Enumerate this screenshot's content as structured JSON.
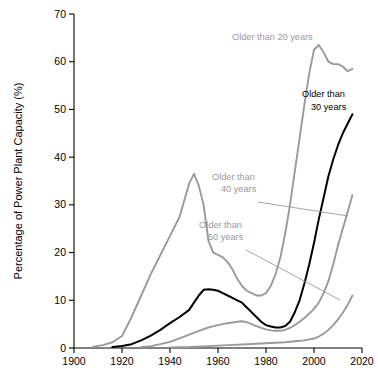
{
  "chart_data": {
    "type": "line",
    "title": "",
    "xlabel": "",
    "ylabel": "Percentage of Power Plant Capacity (%)",
    "xlim": [
      1900,
      2020
    ],
    "ylim": [
      0,
      70
    ],
    "xticks": [
      "1900",
      "1920",
      "1940",
      "1960",
      "1980",
      "2000",
      "2020"
    ],
    "yticks": [
      "0",
      "10",
      "20",
      "30",
      "40",
      "50",
      "60",
      "70"
    ],
    "grid": false,
    "legend_position": "inline-annotations",
    "colors": {
      "gray": "#9a9a9a",
      "black": "#000000",
      "axis": "#000000"
    },
    "annotations": [
      {
        "name": "older-than-20",
        "text_line1": "Older than 20 years",
        "text_line2": "",
        "color": "#9a9a9a"
      },
      {
        "name": "older-than-30",
        "text_line1": "Older than",
        "text_line2": "30 years",
        "color": "#000000"
      },
      {
        "name": "older-than-40",
        "text_line1": "Older than",
        "text_line2": "40 years",
        "color": "#9a9a9a"
      },
      {
        "name": "older-than-50",
        "text_line1": "Older than",
        "text_line2": "50 years",
        "color": "#9a9a9a"
      }
    ],
    "series": [
      {
        "name": "Older than 20 years",
        "color": "#9a9a9a",
        "x": [
          1908,
          1912,
          1916,
          1920,
          1924,
          1928,
          1932,
          1936,
          1940,
          1944,
          1946,
          1948,
          1950,
          1952,
          1954,
          1956,
          1958,
          1960,
          1962,
          1964,
          1966,
          1968,
          1970,
          1972,
          1974,
          1976,
          1978,
          1980,
          1982,
          1984,
          1986,
          1988,
          1990,
          1992,
          1994,
          1996,
          1998,
          2000,
          2002,
          2004,
          2006,
          2008,
          2010,
          2012,
          2014,
          2016
        ],
        "y": [
          0.3,
          0.6,
          1.2,
          2.5,
          6.5,
          11.0,
          15.5,
          19.5,
          23.5,
          27.5,
          31.0,
          34.5,
          36.5,
          34.0,
          30.0,
          22.5,
          20.0,
          19.5,
          19.0,
          18.0,
          16.5,
          14.5,
          13.0,
          12.0,
          11.5,
          11.0,
          11.0,
          11.5,
          13.0,
          15.5,
          19.0,
          24.0,
          30.0,
          37.0,
          44.0,
          51.0,
          57.5,
          62.5,
          63.5,
          62.0,
          60.0,
          59.5,
          59.5,
          59.0,
          58.0,
          58.5
        ]
      },
      {
        "name": "Older than 30 years",
        "color": "#000000",
        "x": [
          1916,
          1920,
          1924,
          1928,
          1932,
          1936,
          1940,
          1944,
          1948,
          1950,
          1952,
          1954,
          1956,
          1958,
          1960,
          1962,
          1964,
          1966,
          1968,
          1970,
          1972,
          1974,
          1976,
          1978,
          1980,
          1982,
          1984,
          1986,
          1988,
          1990,
          1992,
          1994,
          1996,
          1998,
          2000,
          2002,
          2004,
          2006,
          2008,
          2010,
          2012,
          2014,
          2016
        ],
        "y": [
          0.2,
          0.4,
          0.8,
          1.6,
          2.6,
          3.8,
          5.2,
          6.5,
          8.0,
          9.5,
          11.0,
          12.2,
          12.3,
          12.2,
          12.0,
          11.5,
          11.0,
          10.5,
          10.0,
          9.5,
          8.5,
          7.5,
          6.5,
          5.5,
          4.8,
          4.5,
          4.3,
          4.3,
          4.6,
          5.5,
          7.5,
          10.0,
          13.5,
          17.5,
          22.0,
          27.0,
          31.5,
          36.0,
          39.5,
          42.5,
          45.0,
          47.0,
          49.0
        ]
      },
      {
        "name": "Older than 40 years",
        "color": "#9a9a9a",
        "x": [
          1928,
          1932,
          1936,
          1940,
          1944,
          1948,
          1952,
          1956,
          1960,
          1964,
          1968,
          1970,
          1972,
          1974,
          1976,
          1978,
          1980,
          1982,
          1984,
          1986,
          1988,
          1990,
          1992,
          1994,
          1996,
          1998,
          2000,
          2002,
          2004,
          2006,
          2008,
          2010,
          2012,
          2014,
          2016
        ],
        "y": [
          0.2,
          0.4,
          0.8,
          1.3,
          2.0,
          2.8,
          3.6,
          4.3,
          4.8,
          5.2,
          5.5,
          5.6,
          5.4,
          5.0,
          4.6,
          4.2,
          3.9,
          3.7,
          3.6,
          3.6,
          3.8,
          4.2,
          4.8,
          5.5,
          6.3,
          7.2,
          8.2,
          9.5,
          11.5,
          14.0,
          17.5,
          21.5,
          25.0,
          28.5,
          32.0
        ]
      },
      {
        "name": "Older than 50 years",
        "color": "#9a9a9a",
        "x": [
          1940,
          1948,
          1956,
          1964,
          1972,
          1980,
          1984,
          1988,
          1992,
          1996,
          2000,
          2002,
          2004,
          2006,
          2008,
          2010,
          2012,
          2014,
          2016
        ],
        "y": [
          0.1,
          0.2,
          0.4,
          0.6,
          0.8,
          1.0,
          1.1,
          1.2,
          1.4,
          1.6,
          2.0,
          2.4,
          3.0,
          3.8,
          4.8,
          6.0,
          7.4,
          9.0,
          11.0
        ]
      }
    ]
  }
}
